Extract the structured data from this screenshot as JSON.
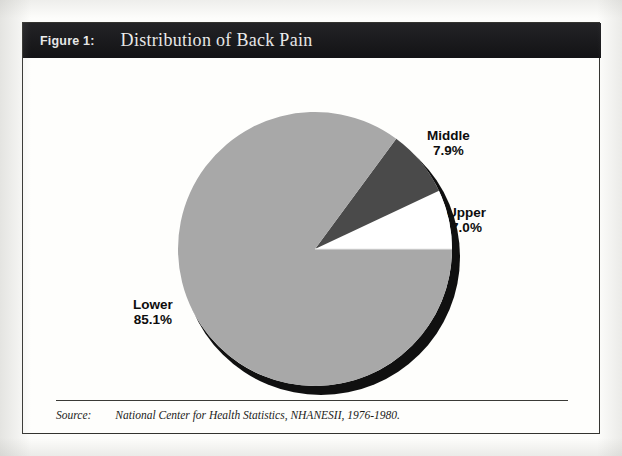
{
  "figure": {
    "number_label": "Figure 1:",
    "title": "Distribution of Back Pain"
  },
  "source": {
    "label": "Source:",
    "text": "National Center for Health Statistics, NHANESII, 1976-1980."
  },
  "colors": {
    "title_bar": "#17171a",
    "title_text": "#ffffff",
    "page_background": "#fdfdfb",
    "frame_border": "#33332f",
    "slice_lower": "#a8a8a8",
    "slice_middle": "#4a4a4a",
    "slice_upper": "#ffffff",
    "pie_shadow": "#101010",
    "label_text": "#0d0d0d"
  },
  "chart_data": {
    "type": "pie",
    "title": "Distribution of Back Pain",
    "categories": [
      "Lower",
      "Middle",
      "Upper"
    ],
    "values": [
      85.1,
      7.9,
      7.0
    ],
    "value_unit": "%",
    "labels": [
      {
        "name": "Lower",
        "pct_text": "85.1%",
        "value": 85.1,
        "color": "#a8a8a8"
      },
      {
        "name": "Middle",
        "pct_text": "7.9%",
        "value": 7.9,
        "color": "#4a4a4a"
      },
      {
        "name": "Upper",
        "pct_text": "7.0%",
        "value": 7.0,
        "color": "#ffffff"
      }
    ],
    "legend": "none",
    "data_labels": "outside",
    "three_d": true,
    "start_angle_deg": 0,
    "direction": "counterclockwise",
    "xlabel": "",
    "ylabel": "",
    "grid": false
  }
}
